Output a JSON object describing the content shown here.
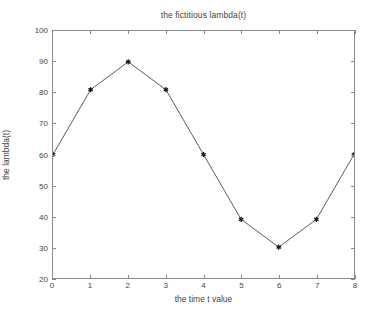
{
  "chart_data": {
    "type": "line",
    "title": "the fictitious lambda(t)",
    "xlabel": "the time t value",
    "ylabel": "the lambda(t)",
    "x": [
      0,
      1,
      2,
      3,
      4,
      5,
      6,
      7,
      8
    ],
    "values": [
      60,
      81,
      90,
      81,
      60,
      39,
      30,
      39,
      60
    ],
    "series": [
      {
        "name": "lambda(t)",
        "values": [
          60,
          81,
          90,
          81,
          60,
          39,
          30,
          39,
          60
        ]
      }
    ],
    "xlim": [
      0,
      8
    ],
    "ylim": [
      20,
      100
    ],
    "xticks": [
      0,
      1,
      2,
      3,
      4,
      5,
      6,
      7,
      8
    ],
    "yticks": [
      20,
      30,
      40,
      50,
      60,
      70,
      80,
      90,
      100
    ],
    "xtick_labels": [
      "0",
      "1",
      "2",
      "3",
      "4",
      "5",
      "6",
      "7",
      "8"
    ],
    "ytick_labels": [
      "20",
      "30",
      "40",
      "50",
      "60",
      "70",
      "80",
      "90",
      "100"
    ],
    "grid": false,
    "legend": null,
    "marker": "star",
    "line_color": "#4a4a4a",
    "marker_color": "#1a1a1a",
    "axis_color": "#8a8a8a",
    "background_color": "#ffffff",
    "text_color": "#444444"
  }
}
